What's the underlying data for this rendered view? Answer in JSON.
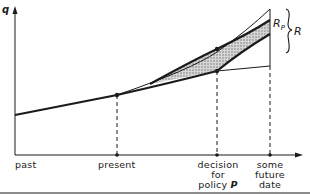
{
  "diagram": {
    "y_axis_label": "q",
    "x_axis_labels": {
      "past": "past",
      "present": "present",
      "decision": [
        "decision",
        "for",
        "policy"
      ],
      "decision_symbol": "P",
      "future": [
        "some",
        "future",
        "date"
      ]
    },
    "region_labels": {
      "rp_main": "R",
      "rp_sub": "P",
      "r": "R"
    },
    "colors": {
      "ink": "#1a1a1a",
      "shade": "#b0b0b0",
      "rule": "#8c8c8c"
    }
  }
}
